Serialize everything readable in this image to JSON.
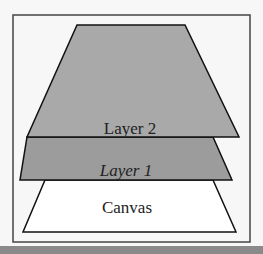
{
  "diagram": {
    "layers": [
      {
        "label": "Layer 2",
        "fill": "#a9a9a9"
      },
      {
        "label": "Layer 1",
        "fill": "#9c9c9c"
      },
      {
        "label": "Canvas",
        "fill": "#ffffff"
      }
    ],
    "frame_color": "#444444",
    "bottom_bar_color": "#8a8a8a"
  }
}
